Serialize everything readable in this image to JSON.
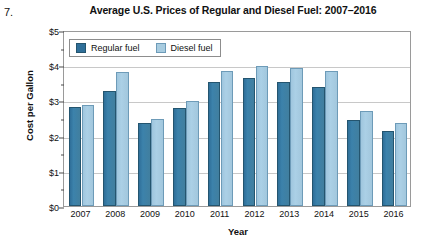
{
  "problem_number": "7.",
  "axis": {
    "ylabel": "Cost per Gallon",
    "xlabel": "Year"
  },
  "legend": {
    "items": [
      {
        "label": "Regular fuel",
        "color": "#2f6f99",
        "key": "regular"
      },
      {
        "label": "Diesel fuel",
        "color": "#a8cce0",
        "key": "diesel"
      }
    ]
  },
  "chart_data": {
    "type": "bar",
    "title": "Average U.S. Prices of Regular and Diesel Fuel: 2007–2016",
    "xlabel": "Year",
    "ylabel": "Cost per Gallon",
    "categories": [
      "2007",
      "2008",
      "2009",
      "2010",
      "2011",
      "2012",
      "2013",
      "2014",
      "2015",
      "2016"
    ],
    "series": [
      {
        "name": "Regular fuel",
        "color": "#2f6f99",
        "values": [
          2.8,
          3.27,
          2.35,
          2.79,
          3.53,
          3.64,
          3.53,
          3.37,
          2.45,
          2.14
        ]
      },
      {
        "name": "Diesel fuel",
        "color": "#a8cce0",
        "values": [
          2.88,
          3.8,
          2.47,
          2.99,
          3.84,
          3.97,
          3.92,
          3.83,
          2.71,
          2.35
        ]
      }
    ],
    "ylim": [
      0,
      5
    ],
    "ytick_labels": [
      "$0",
      "$1",
      "$2",
      "$3",
      "$4",
      "$5"
    ],
    "ytick_values": [
      0,
      1,
      2,
      3,
      4,
      5
    ],
    "yminor_values": [
      0.5,
      1.5,
      2.5,
      3.5,
      4.5
    ],
    "grid": "horizontal",
    "legend_position": "top-left-inside"
  }
}
